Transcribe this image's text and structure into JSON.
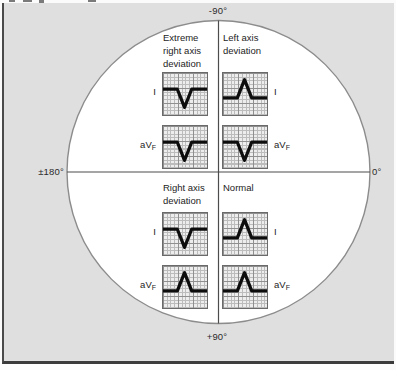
{
  "figure": {
    "axis_labels": {
      "top": "-90°",
      "bottom": "+90°",
      "left": "±180°",
      "right": "0°"
    },
    "colors": {
      "panel_background": "#dfdfdf",
      "circle_fill": "#ffffff",
      "circle_stroke": "#8c8c8c",
      "axis_line": "#4c4c4c",
      "waveform": "#0d0d0d",
      "grid_minor": "#bcbcbc",
      "grid_major": "#8f8f8f"
    }
  },
  "quadrants": [
    {
      "position": "top-left",
      "title": "Extreme right axis deviation",
      "title_lines": [
        "Extreme",
        "right axis",
        "deviation"
      ],
      "leads": [
        {
          "label": "I",
          "sub": "",
          "deflection": "negative"
        },
        {
          "label": "aV",
          "sub": "F",
          "deflection": "negative"
        }
      ]
    },
    {
      "position": "top-right",
      "title": "Left axis deviation",
      "title_lines": [
        "Left axis",
        "deviation",
        ""
      ],
      "leads": [
        {
          "label": "I",
          "sub": "",
          "deflection": "positive"
        },
        {
          "label": "aV",
          "sub": "F",
          "deflection": "negative"
        }
      ]
    },
    {
      "position": "bottom-left",
      "title": "Right axis deviation",
      "title_lines": [
        "Right axis",
        "deviation",
        ""
      ],
      "leads": [
        {
          "label": "I",
          "sub": "",
          "deflection": "negative"
        },
        {
          "label": "aV",
          "sub": "F",
          "deflection": "positive"
        }
      ]
    },
    {
      "position": "bottom-right",
      "title": "Normal",
      "title_lines": [
        "Normal",
        "",
        ""
      ],
      "leads": [
        {
          "label": "I",
          "sub": "",
          "deflection": "positive"
        },
        {
          "label": "aV",
          "sub": "F",
          "deflection": "positive"
        }
      ]
    }
  ]
}
